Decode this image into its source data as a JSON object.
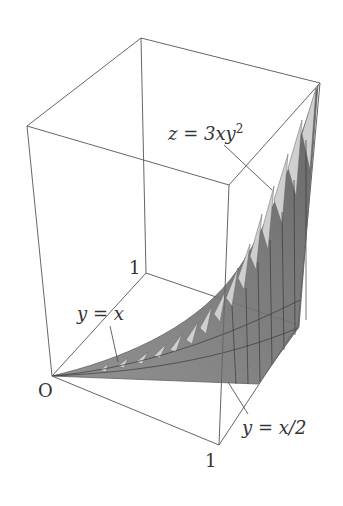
{
  "figure": {
    "surface_label": "z = 3xy²",
    "surface_label_parts": {
      "prefix": "z = 3xy",
      "sup": "2"
    },
    "curve_upper_label": "y = x",
    "curve_lower_label": "y = x/2",
    "origin_label": "O",
    "x_tick_label": "1",
    "y_tick_label": "1"
  },
  "colors": {
    "box_edge": "#666666",
    "surface_dark": "#6e6e6e",
    "surface_mid": "#8a8a8a",
    "surface_light": "#c8c8c8",
    "text": "#333333"
  }
}
